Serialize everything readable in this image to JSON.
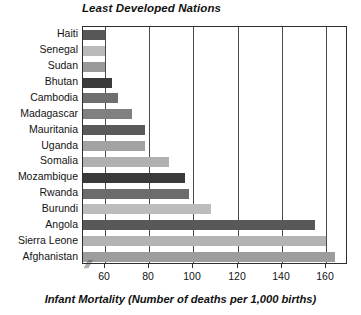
{
  "chart_data": {
    "type": "bar",
    "orientation": "horizontal",
    "title": "Least Developed Nations",
    "xlabel": "Infant Mortality (Number of deaths per 1,000 births)",
    "ylabel": "",
    "xlim": [
      50,
      170
    ],
    "axis_break": true,
    "axis_break_glyph": "⫻",
    "grid": true,
    "grid_axis": "x",
    "legend": "none",
    "xticks": [
      60,
      80,
      100,
      120,
      140,
      160
    ],
    "xtick_labels": [
      "60",
      "80",
      "100",
      "120",
      "140",
      "160"
    ],
    "categories": [
      "Haiti",
      "Senegal",
      "Sudan",
      "Bhutan",
      "Cambodia",
      "Madagascar",
      "Mauritania",
      "Uganda",
      "Somalia",
      "Mozambique",
      "Rwanda",
      "Burundi",
      "Angola",
      "Sierra Leone",
      "Afghanistan"
    ],
    "values": [
      60,
      60,
      60,
      63,
      66,
      72,
      78,
      78,
      89,
      96,
      98,
      108,
      155,
      160,
      164
    ],
    "bar_colors": [
      "#575757",
      "#b9b9b9",
      "#9a9a9a",
      "#3b3b3b",
      "#6f6f6f",
      "#808080",
      "#5a5a5a",
      "#a2a2a2",
      "#b0b0b0",
      "#3a3a3a",
      "#6c6c6c",
      "#bcbcbc",
      "#585858",
      "#b3b3b3",
      "#9d9d9d"
    ]
  },
  "colors": {
    "axis": "#2e2e2e",
    "gridline": "#4a4a4a",
    "text": "#131313",
    "background": "#ffffff"
  }
}
